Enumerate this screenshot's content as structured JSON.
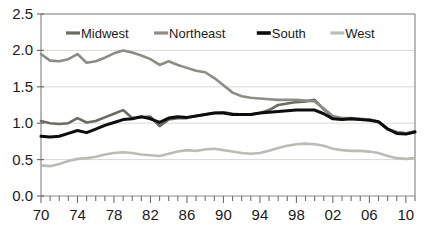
{
  "chart_data": {
    "type": "line",
    "title": "",
    "subtitle": "",
    "xlabel": "",
    "ylabel": "",
    "xlim": [
      1970,
      2011
    ],
    "ylim": [
      0.0,
      2.5
    ],
    "grid": true,
    "grid_axis": "y",
    "legend_position": "top-inside",
    "y_ticks": [
      "0.0",
      "0.5",
      "1.0",
      "1.5",
      "2.0",
      "2.5"
    ],
    "y_tick_values": [
      0.0,
      0.5,
      1.0,
      1.5,
      2.0,
      2.5
    ],
    "x_ticks": [
      "70",
      "74",
      "78",
      "82",
      "86",
      "90",
      "94",
      "98",
      "02",
      "06",
      "10"
    ],
    "x_tick_values": [
      1970,
      1974,
      1978,
      1982,
      1986,
      1990,
      1994,
      1998,
      2002,
      2006,
      2010
    ],
    "x_minor_tick_interval": 1,
    "x": [
      1970,
      1971,
      1972,
      1973,
      1974,
      1975,
      1976,
      1977,
      1978,
      1979,
      1980,
      1981,
      1982,
      1983,
      1984,
      1985,
      1986,
      1987,
      1988,
      1989,
      1990,
      1991,
      1992,
      1993,
      1994,
      1995,
      1996,
      1997,
      1998,
      1999,
      2000,
      2001,
      2002,
      2003,
      2004,
      2005,
      2006,
      2007,
      2008,
      2009,
      2010,
      2011
    ],
    "series": [
      {
        "name": "Midwest",
        "color": "#6b6b63",
        "width": 2.6,
        "values": [
          1.03,
          1.0,
          0.99,
          1.0,
          1.07,
          1.01,
          1.03,
          1.08,
          1.13,
          1.18,
          1.07,
          1.08,
          1.09,
          0.96,
          1.05,
          1.07,
          1.07,
          1.1,
          1.12,
          1.14,
          1.15,
          1.13,
          1.12,
          1.12,
          1.14,
          1.18,
          1.25,
          1.27,
          1.29,
          1.3,
          1.32,
          1.19,
          1.08,
          1.06,
          1.06,
          1.05,
          1.05,
          1.02,
          0.92,
          0.88,
          0.86,
          0.89
        ]
      },
      {
        "name": "Northeast",
        "color": "#8d8d85",
        "width": 2.6,
        "values": [
          1.95,
          1.86,
          1.85,
          1.88,
          1.95,
          1.83,
          1.85,
          1.9,
          1.96,
          2.0,
          1.97,
          1.93,
          1.88,
          1.8,
          1.85,
          1.8,
          1.76,
          1.72,
          1.7,
          1.62,
          1.52,
          1.42,
          1.37,
          1.35,
          1.34,
          1.33,
          1.32,
          1.32,
          1.32,
          1.31,
          1.3,
          1.2,
          1.1,
          1.07,
          1.07,
          1.06,
          1.05,
          1.02,
          0.92,
          0.87,
          0.86,
          0.88
        ]
      },
      {
        "name": "South",
        "color": "#0d0d0d",
        "width": 3.0,
        "values": [
          0.82,
          0.81,
          0.82,
          0.86,
          0.9,
          0.87,
          0.92,
          0.97,
          1.01,
          1.05,
          1.06,
          1.09,
          1.06,
          1.01,
          1.07,
          1.09,
          1.08,
          1.1,
          1.12,
          1.14,
          1.14,
          1.12,
          1.12,
          1.12,
          1.14,
          1.15,
          1.16,
          1.17,
          1.18,
          1.18,
          1.18,
          1.13,
          1.06,
          1.05,
          1.06,
          1.05,
          1.04,
          1.02,
          0.92,
          0.86,
          0.85,
          0.88
        ]
      },
      {
        "name": "West",
        "color": "#bcbcb6",
        "width": 2.6,
        "values": [
          0.42,
          0.41,
          0.44,
          0.48,
          0.51,
          0.52,
          0.54,
          0.57,
          0.59,
          0.6,
          0.59,
          0.57,
          0.56,
          0.55,
          0.58,
          0.61,
          0.63,
          0.62,
          0.64,
          0.65,
          0.63,
          0.61,
          0.59,
          0.58,
          0.59,
          0.62,
          0.66,
          0.69,
          0.71,
          0.72,
          0.71,
          0.69,
          0.65,
          0.63,
          0.62,
          0.62,
          0.61,
          0.59,
          0.55,
          0.52,
          0.51,
          0.52
        ]
      }
    ]
  },
  "legend": {
    "items": [
      {
        "label": "Midwest",
        "color": "#6b6b63"
      },
      {
        "label": "Northeast",
        "color": "#8d8d85"
      },
      {
        "label": "South",
        "color": "#0d0d0d"
      },
      {
        "label": "West",
        "color": "#bcbcb6"
      }
    ]
  },
  "axes": {
    "frame_color": "#8a8a8a",
    "grid_color": "#d8d8d8",
    "tick_color": "#6e6e6e"
  }
}
